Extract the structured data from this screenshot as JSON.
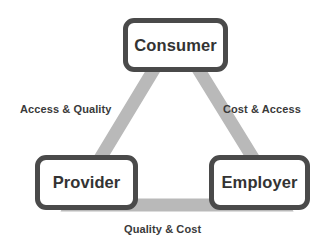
{
  "diagram": {
    "type": "triangle-relationship",
    "background_color": "#ffffff",
    "triangle_color": "#b9b9b9",
    "node_border_color": "#4a4a4a",
    "node_fill_color": "#ffffff",
    "text_color": "#333333",
    "nodes": [
      {
        "id": "consumer",
        "label": "Consumer",
        "position": "top"
      },
      {
        "id": "provider",
        "label": "Provider",
        "position": "bottom-left"
      },
      {
        "id": "employer",
        "label": "Employer",
        "position": "bottom-right"
      }
    ],
    "edges": [
      {
        "id": "left",
        "label": "Access & Quality",
        "from": "consumer",
        "to": "provider"
      },
      {
        "id": "right",
        "label": "Cost & Access",
        "from": "consumer",
        "to": "employer"
      },
      {
        "id": "bottom",
        "label": "Quality & Cost",
        "from": "provider",
        "to": "employer"
      }
    ]
  }
}
